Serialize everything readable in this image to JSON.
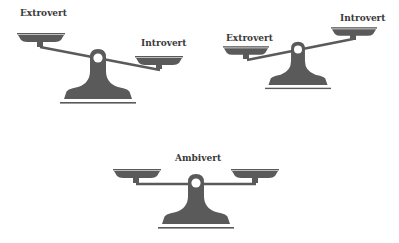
{
  "diagram": {
    "title": "",
    "colors": {
      "scale": "#5a5a5a",
      "text": "#3a3a3a",
      "background": "#ffffff"
    },
    "scales": [
      {
        "id": "scale-extrovert-heavy",
        "left_label": "Extrovert",
        "right_label": "Introvert",
        "tilt": "left-up-right-down"
      },
      {
        "id": "scale-introvert-heavy",
        "left_label": "Extrovert",
        "right_label": "Introvert",
        "tilt": "left-down-right-up"
      },
      {
        "id": "scale-balanced",
        "center_label": "Ambivert",
        "tilt": "balanced"
      }
    ]
  }
}
